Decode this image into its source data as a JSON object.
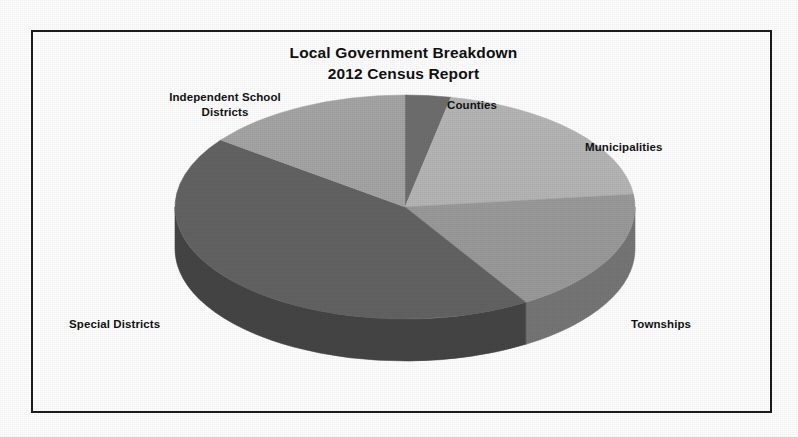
{
  "document": {
    "background_color": "#ffffff",
    "frame_color": "#1c1c1c"
  },
  "chart_data": {
    "type": "pie",
    "title": "Local Government Breakdown",
    "subtitle": "2012 Census Report",
    "three_d": true,
    "start_angle_deg": 0,
    "direction": "clockwise",
    "legend": "none",
    "labels_position": "outside",
    "categories": [
      "Counties",
      "Municipalities",
      "Townships",
      "Special Districts",
      "Independent School Districts"
    ],
    "values": [
      3.2,
      20.0,
      18.0,
      44.0,
      14.8
    ],
    "value_unit": "percent",
    "colors": [
      "#6e6e6e",
      "#b5b5b5",
      "#9a9a9a",
      "#636363",
      "#a5a5a5"
    ],
    "side_colors": [
      "#4a4a4a",
      "#8e8e8e",
      "#767676",
      "#454545",
      "#7e7e7e"
    ],
    "slices": [
      {
        "label": "Counties",
        "value": 3.2,
        "color": "#6e6e6e",
        "side_color": "#4a4a4a"
      },
      {
        "label": "Municipalities",
        "value": 20.0,
        "color": "#b5b5b5",
        "side_color": "#8e8e8e"
      },
      {
        "label": "Townships",
        "value": 18.0,
        "color": "#9a9a9a",
        "side_color": "#767676"
      },
      {
        "label": "Special Districts",
        "value": 44.0,
        "color": "#636363",
        "side_color": "#454545"
      },
      {
        "label": "Independent School Districts",
        "value": 14.8,
        "color": "#a5a5a5",
        "side_color": "#7e7e7e"
      }
    ],
    "xlabel": "",
    "ylabel": ""
  },
  "labels": {
    "counties": "Counties",
    "municipalities": "Municipalities",
    "townships": "Townships",
    "special_districts": "Special Districts",
    "independent_school_districts": "Independent School\nDistricts"
  }
}
